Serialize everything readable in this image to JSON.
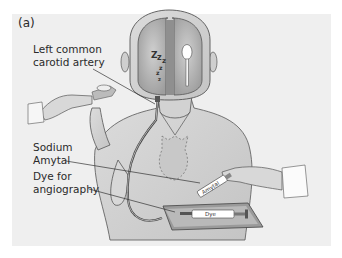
{
  "figure": {
    "panel_label": "(a)",
    "labels": {
      "carotid_line1": "Left common",
      "carotid_line2": "carotid artery",
      "sodium_line1": "Sodium",
      "sodium_line2": "Amytal",
      "dye_line1": "Dye for",
      "dye_line2": "angiography"
    },
    "syringe_labels": {
      "amytal": "Amytal",
      "dye": "Dye"
    },
    "brain": {
      "left_hemisphere_symbol": "zzz (asleep)",
      "right_hemisphere_symbol": "spoon"
    },
    "colors": {
      "panel_bg": "#efefef",
      "skin": "#d6d6d6",
      "brain": "#bdbdbd",
      "line": "#3a3a3a"
    }
  }
}
